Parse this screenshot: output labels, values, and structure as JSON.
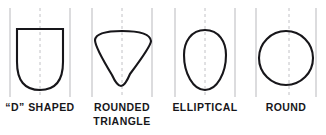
{
  "figure": {
    "background_color": "#ffffff",
    "outline_color": "#17161a",
    "guide_color": "#b9b9bd",
    "centerline_color": "#c2c2c6",
    "outline_width": 2.1,
    "guide_width": 1
  },
  "panels": [
    {
      "id": "d-shaped",
      "label": "“D” SHAPED",
      "shape": "d-shape",
      "description": "Flat top edge with straight vertical sides and a rounded U-shaped bottom",
      "guides": {
        "left_x": 10,
        "right_x": 70,
        "center_x": 40,
        "top_y": 8,
        "bottom_y": 97
      },
      "outline": {
        "left_x": 17,
        "right_x": 63,
        "top_y": 29,
        "bottom_y": 90
      }
    },
    {
      "id": "rounded-triangle",
      "label": "ROUNDED\nTRIANGLE",
      "shape": "rounded-triangle",
      "description": "Downward pointing triangle with curved top edge, concave sides and rounded apex",
      "guides": {
        "left_x": 10,
        "right_x": 70,
        "center_x": 40,
        "top_y": 8,
        "bottom_y": 97
      },
      "outline": {
        "left_x": 12,
        "right_x": 70,
        "top_y": 31,
        "bottom_y": 86
      }
    },
    {
      "id": "elliptical",
      "label": "ELLIPTICAL",
      "shape": "egg-ellipse",
      "description": "Tall egg shaped oval, broader above centre and tapering to a narrower rounded base",
      "guides": {
        "left_x": 10,
        "right_x": 70,
        "center_x": 40,
        "top_y": 8,
        "bottom_y": 97
      },
      "outline": {
        "left_x": 21,
        "right_x": 61,
        "top_y": 30,
        "bottom_y": 90
      }
    },
    {
      "id": "round",
      "label": "ROUND",
      "shape": "circle",
      "description": "Near perfect circle",
      "guides": {
        "left_x": 10,
        "right_x": 70,
        "center_x": 40,
        "top_y": 8,
        "bottom_y": 97
      },
      "outline": {
        "left_x": 13,
        "right_x": 67,
        "top_y": 31,
        "bottom_y": 85
      }
    }
  ]
}
